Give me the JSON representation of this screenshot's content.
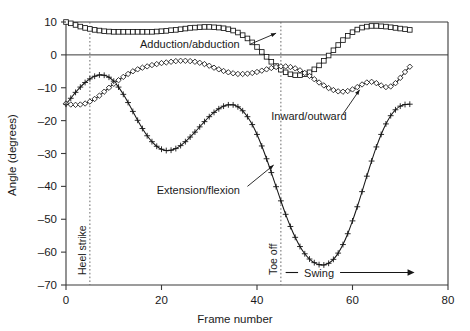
{
  "chart_data": {
    "type": "line",
    "title": "",
    "xlabel": "Frame number",
    "ylabel": "Angle (degrees)",
    "xlim": [
      0,
      80
    ],
    "ylim": [
      -70,
      10
    ],
    "xticks": [
      0,
      20,
      40,
      60,
      80
    ],
    "yticks": [
      10,
      0,
      -10,
      -20,
      -30,
      -40,
      -50,
      -60,
      -70
    ],
    "xtick_labels": [
      "0",
      "20",
      "40",
      "60",
      "80"
    ],
    "ytick_labels": [
      "10",
      "0",
      "–10",
      "–20",
      "–30",
      "–40",
      "–50",
      "–60",
      "–70"
    ],
    "grid": false,
    "legend_position": "inline-annotations",
    "zero_reference_line": 0,
    "series": [
      {
        "name": "Adduction/abduction",
        "marker": "square",
        "x": [
          0,
          1,
          2,
          3,
          4,
          5,
          6,
          7,
          8,
          9,
          10,
          11,
          12,
          13,
          14,
          15,
          16,
          17,
          18,
          19,
          20,
          21,
          22,
          23,
          24,
          25,
          26,
          27,
          28,
          29,
          30,
          31,
          32,
          33,
          34,
          35,
          36,
          37,
          38,
          39,
          40,
          41,
          42,
          43,
          44,
          45,
          46,
          47,
          48,
          49,
          50,
          51,
          52,
          53,
          54,
          55,
          56,
          57,
          58,
          59,
          60,
          61,
          62,
          63,
          64,
          65,
          66,
          67,
          68,
          69,
          70,
          71,
          72
        ],
        "values": [
          10.0,
          9.6,
          9.1,
          8.6,
          8.2,
          7.9,
          7.6,
          7.4,
          7.2,
          7.1,
          7.0,
          7.0,
          7.0,
          7.0,
          7.0,
          7.0,
          7.0,
          7.0,
          7.0,
          7.1,
          7.2,
          7.3,
          7.5,
          7.6,
          7.8,
          8.0,
          8.2,
          8.3,
          8.4,
          8.5,
          8.5,
          8.4,
          8.3,
          8.1,
          7.8,
          7.4,
          6.8,
          6.0,
          5.0,
          3.8,
          2.4,
          0.9,
          -0.6,
          -2.1,
          -3.4,
          -4.5,
          -5.3,
          -5.9,
          -6.2,
          -6.2,
          -5.9,
          -5.3,
          -4.4,
          -3.2,
          -1.8,
          -0.2,
          1.4,
          3.0,
          4.5,
          5.8,
          6.9,
          7.7,
          8.3,
          8.6,
          8.8,
          8.8,
          8.7,
          8.6,
          8.4,
          8.2,
          8.0,
          7.8,
          7.6
        ]
      },
      {
        "name": "Inward/outward",
        "marker": "diamond",
        "x": [
          0,
          1,
          2,
          3,
          4,
          5,
          6,
          7,
          8,
          9,
          10,
          11,
          12,
          13,
          14,
          15,
          16,
          17,
          18,
          19,
          20,
          21,
          22,
          23,
          24,
          25,
          26,
          27,
          28,
          29,
          30,
          31,
          32,
          33,
          34,
          35,
          36,
          37,
          38,
          39,
          40,
          41,
          42,
          43,
          44,
          45,
          46,
          47,
          48,
          49,
          50,
          51,
          52,
          53,
          54,
          55,
          56,
          57,
          58,
          59,
          60,
          61,
          62,
          63,
          64,
          65,
          66,
          67,
          68,
          69,
          70,
          71,
          72
        ],
        "values": [
          -14.8,
          -15.1,
          -15.2,
          -15.1,
          -14.8,
          -14.2,
          -13.4,
          -12.4,
          -11.2,
          -10.0,
          -8.8,
          -7.7,
          -6.7,
          -5.8,
          -5.0,
          -4.4,
          -3.9,
          -3.5,
          -3.1,
          -2.8,
          -2.5,
          -2.3,
          -2.1,
          -1.9,
          -1.8,
          -1.8,
          -1.9,
          -2.1,
          -2.4,
          -2.8,
          -3.3,
          -3.9,
          -4.4,
          -4.9,
          -5.3,
          -5.6,
          -5.8,
          -5.8,
          -5.7,
          -5.5,
          -5.2,
          -4.8,
          -4.4,
          -4.0,
          -3.7,
          -3.5,
          -3.5,
          -3.7,
          -4.1,
          -4.7,
          -5.5,
          -6.4,
          -7.4,
          -8.4,
          -9.3,
          -10.1,
          -10.7,
          -11.1,
          -11.2,
          -11.0,
          -10.5,
          -9.8,
          -9.0,
          -8.4,
          -8.2,
          -8.6,
          -9.3,
          -9.8,
          -9.6,
          -8.6,
          -7.0,
          -5.2,
          -3.6
        ]
      },
      {
        "name": "Extension/flexion",
        "marker": "plus",
        "x": [
          0,
          1,
          2,
          3,
          4,
          5,
          6,
          7,
          8,
          9,
          10,
          11,
          12,
          13,
          14,
          15,
          16,
          17,
          18,
          19,
          20,
          21,
          22,
          23,
          24,
          25,
          26,
          27,
          28,
          29,
          30,
          31,
          32,
          33,
          34,
          35,
          36,
          37,
          38,
          39,
          40,
          41,
          42,
          43,
          44,
          45,
          46,
          47,
          48,
          49,
          50,
          51,
          52,
          53,
          54,
          55,
          56,
          57,
          58,
          59,
          60,
          61,
          62,
          63,
          64,
          65,
          66,
          67,
          68,
          69,
          70,
          71,
          72
        ],
        "values": [
          -15.0,
          -13.2,
          -11.4,
          -9.8,
          -8.4,
          -7.3,
          -6.5,
          -6.1,
          -6.2,
          -6.8,
          -8.0,
          -9.8,
          -12.0,
          -14.5,
          -17.2,
          -19.9,
          -22.4,
          -24.6,
          -26.4,
          -27.8,
          -28.7,
          -29.1,
          -29.0,
          -28.5,
          -27.6,
          -26.4,
          -25.0,
          -23.5,
          -21.9,
          -20.3,
          -18.8,
          -17.5,
          -16.4,
          -15.6,
          -15.2,
          -15.2,
          -15.8,
          -17.0,
          -18.8,
          -21.2,
          -24.2,
          -27.7,
          -31.6,
          -35.8,
          -40.1,
          -44.4,
          -48.5,
          -52.2,
          -55.5,
          -58.3,
          -60.5,
          -62.1,
          -63.2,
          -63.8,
          -63.9,
          -63.4,
          -62.2,
          -60.3,
          -57.7,
          -54.4,
          -50.5,
          -46.2,
          -41.6,
          -36.9,
          -32.3,
          -28.0,
          -24.2,
          -21.0,
          -18.5,
          -16.7,
          -15.6,
          -15.1,
          -15.0
        ]
      }
    ],
    "annotations": [
      {
        "name": "adduction-abduction-label",
        "text": "Adduction/abduction",
        "x": 15.5,
        "y": 3.2
      },
      {
        "name": "inward-outward-label",
        "text": "Inward/outward",
        "x": 43.0,
        "y": -18.5
      },
      {
        "name": "extension-flexion-label",
        "text": "Extension/flexion",
        "x": 19.0,
        "y": -41.0
      },
      {
        "name": "swing-label",
        "text": "Swing",
        "x": 53.0,
        "y": -66.0
      }
    ],
    "event_markers": [
      {
        "name": "heel-strike",
        "label": "Heel strike",
        "x": 5
      },
      {
        "name": "toe-off",
        "label": "Toe off",
        "x": 45
      }
    ],
    "phase_spans": [
      {
        "name": "swing-phase",
        "label": "Swing",
        "x_start": 46,
        "x_end": 73
      }
    ]
  }
}
